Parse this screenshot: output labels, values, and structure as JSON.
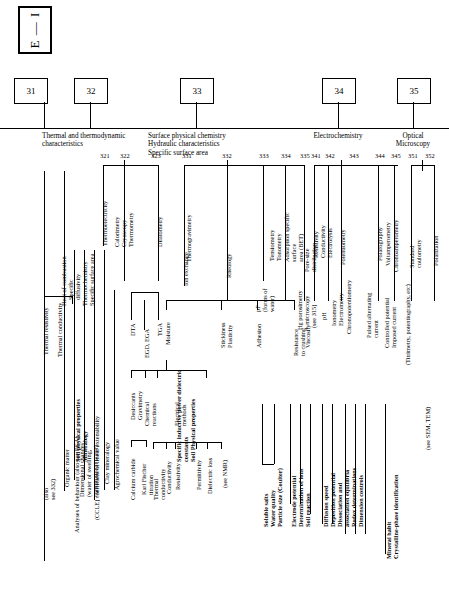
{
  "diagram": {
    "title_box": "E — I",
    "level1": [
      {
        "num": "31",
        "label": "Soil behaviour\nHeat transmission"
      },
      {
        "num": "32",
        "label": "Thermal and thermodynamic\ncharacteristics"
      },
      {
        "num": "33",
        "label": "Surface physical chemistry\nHydraulic characteristics\nSpecific surface area"
      },
      {
        "num": "34",
        "label": "Electrochemistry"
      },
      {
        "num": "35",
        "label": "Optical\nMicroscopy"
      }
    ],
    "level2_numbers": [
      "321",
      "322",
      "323",
      "331",
      "332",
      "333",
      "334",
      "335",
      "341",
      "342",
      "343",
      "344",
      "345",
      "351",
      "352"
    ],
    "branch_labels": {
      "thermal_resistivity": "Thermal resistivity",
      "thermal_conductivity": "Thermal conductivity",
      "thermoelectricity": "Thermoelectricity",
      "calorimetry": "Calorimetry",
      "cryoscopy": "Cryoscopy",
      "thermometry": "Thermometry",
      "heat_of_combustion": "Heat of combustion",
      "specific_diffusivity": "Specific\ndiffusivity",
      "thermochemistry": "Thermochemistry",
      "specific_surface_area": "Specific surface area",
      "dilatometry": "Dilatometry",
      "thermogravimetry": "Thermogravimetry",
      "ion_exchange": "Ion exchange",
      "rheology": "Rheology",
      "pf_forms_of_water": "pF\n(forms of\nwater)",
      "tensiometry": "Tensiometry",
      "tonometry": "Tonometry",
      "adsorption_bet": "Adsorption specific\nsurface\narea (BET)",
      "hg_porosimetry": "Hg porosimetry\n+ microscopy",
      "pore_size_distribution": "Pore-size\ndistribution",
      "resistivity": "Resistivity",
      "conductivity": "Conductivity",
      "electrolysis": "Electrolysis",
      "see_315": "(see 315)",
      "ph": "pH",
      "ionometry": "Ionometry",
      "electrometry": "Electrometry",
      "potentiometry": "Potentiometry",
      "amperometry": "Amperometry",
      "chronopotentiometry": "Chronopotentiometry",
      "pulsed_alternating_current": "Pulsed alternating\ncurrent",
      "polarography": "Polarography",
      "voltamperometry": "Voltamperometry",
      "chronoamperometry": "Chronoamperometry",
      "controlled_potential": "Controlled potential",
      "imposed_current": "Imposed current",
      "standard_coulometry": "Standard\ncoulometry",
      "polarization": "Polarization",
      "also_see_332": "(also\nsee 332)",
      "organic_matter": "Organic matter",
      "analyses_of_behaviour": "Analyses of behaviour (also see EGA)",
      "dimensional_changes": "Dimensional changes\n(water of swelling,\nconstitutional water)",
      "ccle": "(CCLE) coefficient of linear extensibility",
      "clay_mineralogy": "Clay mineralogy",
      "agrochemical_value": "Agrochemical value",
      "dta": "DTA",
      "tga": "TGA",
      "egd_ega": "EGD, EGA",
      "moisture": "Moisture",
      "desiccants": "Desiccants",
      "gravimetry": "Gravimetry",
      "chemical_reactions": "Chemical\nreactions",
      "electrical_methods": "Electrical\nmethods",
      "calcium_carbide": "Calcium carbide",
      "karl_fischer": "Karl Fischer\ntitration",
      "thermal_conductivity2": "Thermal\nconductivity",
      "conductivity2": "Conductivity",
      "resistivity2": "Resistivity",
      "permittivity": "Permittivity",
      "dielectric_loss": "Dielectric loss",
      "see_nmr": "(see NMR)",
      "stickiness": "Stickiness",
      "plasticity": "Plasticity",
      "adhesion": "Adhesion",
      "resistance_to_crushing": "Resistance\nto crushing",
      "viscosity": "Viscosity",
      "titrimetry": "(Titrimetry, potentiography, etc)",
      "see_sem_tem": "(see SEM, TEM)"
    },
    "bottom_groups": [
      {
        "name": "soil-physical-properties-mineralogy",
        "text": "Soil physical properties\nMineralogy"
      },
      {
        "name": "specific-inductive-power",
        "text": "Specific inductive power dielectric\nconstants\nSoil Physical properties"
      },
      {
        "name": "soluble-salts-group",
        "text": "Soluble salts\nWater quality\nParticle size (Coulter)"
      },
      {
        "name": "electrode-potential-group",
        "text": "Electrode potential\nDetermination of ions\nSoil reaction"
      },
      {
        "name": "diffusion-speed-group",
        "text": "Diffusion speed\nDeposition potential\nDissociation and\nassociation equilibria\nRedox determinations\nDimension controls"
      },
      {
        "name": "mineral-habit-group",
        "text": "Mineral habit\nCrystalline-phase identification"
      }
    ]
  }
}
